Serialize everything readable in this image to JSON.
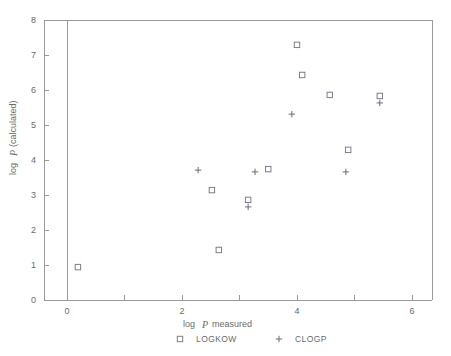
{
  "chart_data": {
    "type": "scatter",
    "title": "",
    "xlabel": "log P measured",
    "ylabel": "log P (calculated)",
    "xlabel_parts": {
      "pre": "log",
      "italic": "P",
      "post": "measured"
    },
    "ylabel_parts": {
      "pre": "log",
      "italic": "P",
      "post": "(calculated)"
    },
    "xlim": [
      -0.35,
      6.7
    ],
    "ylim": [
      0,
      8
    ],
    "xticks": [
      0,
      1,
      2,
      3,
      4,
      5,
      6
    ],
    "xtick_labels": [
      "0",
      "",
      "2",
      "",
      "4",
      "",
      "6"
    ],
    "yticks": [
      0,
      1,
      2,
      3,
      4,
      5,
      6,
      7,
      8
    ],
    "ytick_labels": [
      "0",
      "1",
      "2",
      "3",
      "4",
      "5",
      "6",
      "7",
      "8"
    ],
    "grid": false,
    "legend_position": "bottom",
    "marker_colors": {
      "logkow": "#7d7d8c",
      "clogp": "#6b6b78"
    },
    "series": [
      {
        "name": "LOGKOW",
        "marker": "square",
        "points": [
          [
            0.19,
            0.94
          ],
          [
            2.64,
            1.43
          ],
          [
            2.52,
            3.14
          ],
          [
            3.15,
            2.86
          ],
          [
            3.5,
            3.74
          ],
          [
            4.0,
            7.29
          ],
          [
            4.09,
            6.43
          ],
          [
            4.57,
            5.86
          ],
          [
            4.89,
            4.29
          ],
          [
            5.44,
            5.83
          ]
        ]
      },
      {
        "name": "CLOGP",
        "marker": "plus",
        "points": [
          [
            2.28,
            3.71
          ],
          [
            3.15,
            2.66
          ],
          [
            3.27,
            3.66
          ],
          [
            3.91,
            5.31
          ],
          [
            4.85,
            3.66
          ],
          [
            5.44,
            5.63
          ]
        ]
      }
    ],
    "legend": [
      {
        "label": "LOGKOW",
        "marker": "square"
      },
      {
        "label": "CLOGP",
        "marker": "plus"
      }
    ]
  }
}
